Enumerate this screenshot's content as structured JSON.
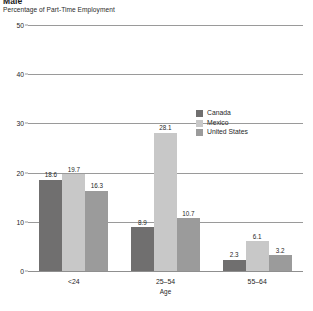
{
  "header": {
    "title": "Male",
    "subtitle": "Percentage of Part-Time Employment"
  },
  "legend": {
    "position": "inside-top-right",
    "items": [
      {
        "label": "Canada",
        "color": "#706f6f"
      },
      {
        "label": "Mexico",
        "color": "#c8c8c8"
      },
      {
        "label": "United States",
        "color": "#9b9b9b"
      }
    ]
  },
  "axes": {
    "y_ticks": [
      "0",
      "10",
      "20",
      "30",
      "40",
      "50"
    ],
    "x_ticks": [
      "<24",
      "25–54",
      "55–64"
    ],
    "x_title": "Age"
  },
  "chart_data": {
    "type": "bar",
    "title": "Male",
    "subtitle": "Percentage of Part-Time Employment",
    "xlabel": "Age",
    "ylabel": "",
    "categories": [
      "<24",
      "25–54",
      "55–64"
    ],
    "series": [
      {
        "name": "Canada",
        "color": "#706f6f",
        "values": [
          18.6,
          8.9,
          2.3
        ]
      },
      {
        "name": "Mexico",
        "color": "#c8c8c8",
        "values": [
          19.7,
          28.1,
          6.1
        ]
      },
      {
        "name": "United States",
        "color": "#9b9b9b",
        "values": [
          16.3,
          10.7,
          3.2
        ]
      }
    ],
    "ylim": [
      0,
      50
    ],
    "ytick_values": [
      0,
      10,
      20,
      30,
      40,
      50
    ],
    "grid": true,
    "data_labels": true,
    "legend_position": "inside-top-right"
  }
}
